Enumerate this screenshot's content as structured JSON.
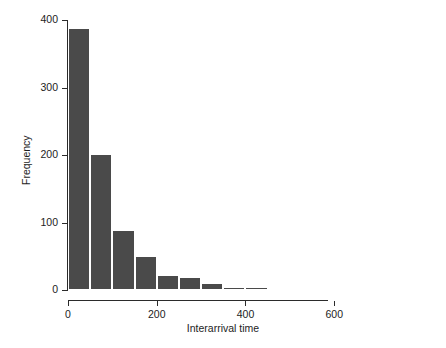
{
  "top_caption": "",
  "chart_data": {
    "type": "bar",
    "title": "",
    "subtitle": "",
    "xlabel": "Interarrival time",
    "ylabel": "Frequency",
    "xlim": [
      0,
      800
    ],
    "ylim": [
      0,
      400
    ],
    "grid": false,
    "legend": null,
    "bin_width": 50,
    "bar_color": "#4a4a4a",
    "bar_edge_color": "#ffffff",
    "axis_color": "#2b2b2b",
    "xticks": [
      0,
      200,
      400,
      600
    ],
    "xtick_labels": [
      "0",
      "200",
      "400",
      "600"
    ],
    "yticks": [
      0,
      100,
      200,
      300,
      400
    ],
    "ytick_labels": [
      "0",
      "100",
      "200",
      "300",
      "400"
    ],
    "bins": [
      {
        "x0": 0,
        "x1": 50,
        "value": 388
      },
      {
        "x0": 50,
        "x1": 100,
        "value": 201
      },
      {
        "x0": 100,
        "x1": 150,
        "value": 89
      },
      {
        "x0": 150,
        "x1": 200,
        "value": 50
      },
      {
        "x0": 200,
        "x1": 250,
        "value": 22
      },
      {
        "x0": 250,
        "x1": 300,
        "value": 20
      },
      {
        "x0": 300,
        "x1": 350,
        "value": 11
      },
      {
        "x0": 350,
        "x1": 400,
        "value": 5
      },
      {
        "x0": 400,
        "x1": 450,
        "value": 5
      },
      {
        "x0": 450,
        "x1": 500,
        "value": 0
      },
      {
        "x0": 500,
        "x1": 550,
        "value": 2
      },
      {
        "x0": 550,
        "x1": 600,
        "value": 0
      },
      {
        "x0": 600,
        "x1": 650,
        "value": 0
      },
      {
        "x0": 650,
        "x1": 700,
        "value": 2
      },
      {
        "x0": 700,
        "x1": 750,
        "value": 0
      },
      {
        "x0": 750,
        "x1": 800,
        "value": 0
      }
    ]
  },
  "geometry": {
    "x_pixel_at_0": 68,
    "x_pixels_per_unit": 0.4437,
    "y_pixel_at_0": 290,
    "y_pixels_per_unit": 0.675
  }
}
